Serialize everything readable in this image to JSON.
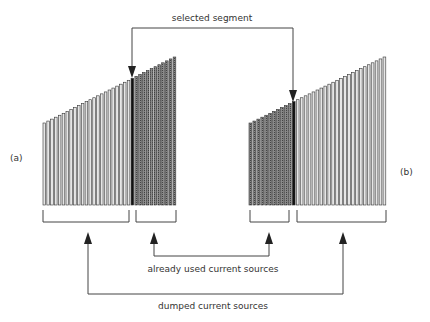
{
  "labels": {
    "selected_segment": "selected segment",
    "already_used": "already used current sources",
    "dumped": "dumped current sources",
    "panel_a": "(a)",
    "panel_b": "(b)"
  },
  "colors": {
    "light_bar_fill": "#e6e6e6",
    "dark_bar_fill": "#7a7a7a",
    "selected_bar_fill": "#111111",
    "stroke": "#333333",
    "line": "#444444"
  },
  "panels": [
    {
      "id": "a",
      "order": [
        "light",
        "selected",
        "dark"
      ],
      "light_count": 23,
      "dark_count": 11,
      "x_start": 43,
      "x_end": 177,
      "baseline": 205,
      "top_left": 123,
      "top_right": 57
    },
    {
      "id": "b",
      "order": [
        "dark",
        "selected",
        "light"
      ],
      "light_count": 23,
      "dark_count": 11,
      "x_start": 249,
      "x_end": 387,
      "baseline": 205,
      "top_left": 123,
      "top_right": 57
    }
  ]
}
